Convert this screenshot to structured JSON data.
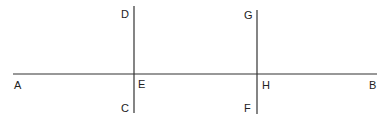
{
  "diagram": {
    "stroke_color": "#333333",
    "lines": [
      {
        "id": "AB",
        "from": "A",
        "to": "B",
        "x1": 13,
        "y1": 74,
        "x2": 377,
        "y2": 74
      },
      {
        "id": "DC",
        "from": "D",
        "to": "C",
        "x1": 134,
        "y1": 6,
        "x2": 134,
        "y2": 113
      },
      {
        "id": "GF",
        "from": "G",
        "to": "F",
        "x1": 257,
        "y1": 10,
        "x2": 257,
        "y2": 114
      }
    ],
    "points": [
      {
        "label": "A",
        "x": 14,
        "y": 89
      },
      {
        "label": "B",
        "x": 369,
        "y": 89
      },
      {
        "label": "D",
        "x": 121,
        "y": 18
      },
      {
        "label": "C",
        "x": 121,
        "y": 112
      },
      {
        "label": "E",
        "x": 138,
        "y": 88
      },
      {
        "label": "G",
        "x": 244,
        "y": 19
      },
      {
        "label": "F",
        "x": 244,
        "y": 112
      },
      {
        "label": "H",
        "x": 262,
        "y": 89
      }
    ]
  }
}
